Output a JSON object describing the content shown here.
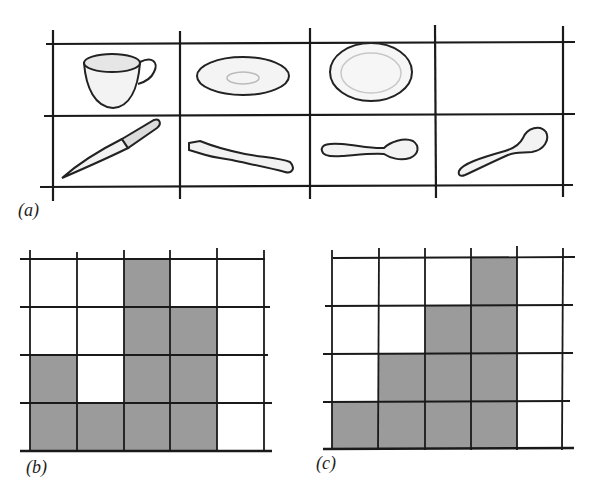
{
  "panel_a": {
    "label": "(a)",
    "rows": [
      [
        "cup",
        "saucer",
        "plate",
        "empty"
      ],
      [
        "knife",
        "fork",
        "teaspoon",
        "spoon"
      ]
    ],
    "grid": {
      "x": [
        53,
        180,
        310,
        435,
        563
      ],
      "y": [
        44,
        116,
        186
      ]
    }
  },
  "panel_b": {
    "label": "(b)",
    "columns": 5,
    "rows": 4,
    "column_heights": [
      2,
      1,
      4,
      3,
      0
    ],
    "grid": {
      "x": [
        30,
        77,
        124,
        170,
        217,
        264
      ],
      "y": [
        259,
        307,
        355,
        403,
        451
      ]
    }
  },
  "panel_c": {
    "label": "(c)",
    "columns": 5,
    "rows": 4,
    "column_heights": [
      1,
      2,
      3,
      4,
      0
    ],
    "grid": {
      "x": [
        332,
        379,
        425,
        471,
        517,
        563
      ],
      "y": [
        258,
        306,
        354,
        402,
        449
      ]
    }
  },
  "colors": {
    "line": "#1a1a1a",
    "fill": "#9b9b9b",
    "object_stroke": "#222222",
    "object_fill": "#f2f2f2"
  }
}
